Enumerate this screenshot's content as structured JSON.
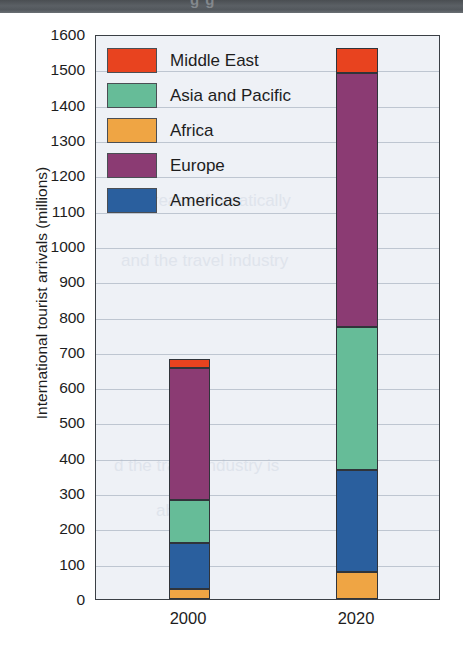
{
  "scan_band": {
    "partial_text": "g  g"
  },
  "chart_data": {
    "type": "bar",
    "stacked": true,
    "title": "",
    "xlabel": "",
    "ylabel": "International tourist arrivals (millions)",
    "categories": [
      "2000",
      "2020"
    ],
    "ylim": [
      0,
      1600
    ],
    "yticks": [
      1600,
      1500,
      1400,
      1300,
      1200,
      1100,
      1000,
      900,
      800,
      700,
      600,
      500,
      400,
      300,
      200,
      100,
      0
    ],
    "grid": true,
    "legend_position": "upper-left-inside",
    "series": [
      {
        "name": "Middle East",
        "color": "#e8431f",
        "values": [
          25,
          70
        ]
      },
      {
        "name": "Asia and Pacific",
        "color": "#66bc98",
        "values": [
          120,
          405
        ]
      },
      {
        "name": "Africa",
        "color": "#efa544",
        "values": [
          28,
          77
        ]
      },
      {
        "name": "Europe",
        "color": "#8b3b73",
        "values": [
          375,
          720
        ]
      },
      {
        "name": "Americas",
        "color": "#2a5f9e",
        "values": [
          132,
          288
        ]
      }
    ],
    "stack_order_bottom_to_top": [
      "Africa",
      "Americas",
      "Asia and Pacific",
      "Europe",
      "Middle East"
    ],
    "totals": [
      680,
      1560
    ],
    "annotations": []
  },
  "legend": {
    "items": [
      {
        "label": "Middle East",
        "color": "#e8431f"
      },
      {
        "label": "Asia and Pacific",
        "color": "#66bc98"
      },
      {
        "label": "Africa",
        "color": "#efa544"
      },
      {
        "label": "Europe",
        "color": "#8b3b73"
      },
      {
        "label": "Americas",
        "color": "#2a5f9e"
      }
    ]
  },
  "bleed_text": [
    "increase dramatically",
    "and the travel industry",
    "d the travel industry is",
    "able"
  ]
}
